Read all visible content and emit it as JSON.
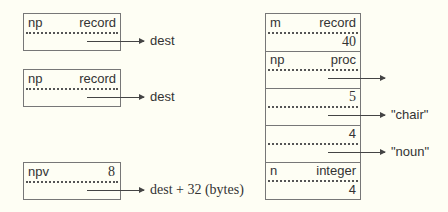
{
  "left_boxes": [
    {
      "name": "np",
      "type": "record",
      "target": "dest"
    },
    {
      "name": "np",
      "type": "record",
      "target": "dest"
    },
    {
      "name": "npv",
      "type": "8",
      "target": "dest + 32 (bytes)"
    }
  ],
  "right_box": {
    "rows": [
      {
        "name": "m",
        "type": "record",
        "value": "40",
        "target": ""
      },
      {
        "name": "np",
        "type": "proc",
        "value": "",
        "target": ""
      },
      {
        "name": "",
        "type": "5",
        "value": "",
        "target": "\"chair\""
      },
      {
        "name": "",
        "type": "4",
        "value": "",
        "target": "\"noun\""
      },
      {
        "name": "n",
        "type": "integer",
        "value": "4",
        "target": ""
      }
    ]
  }
}
